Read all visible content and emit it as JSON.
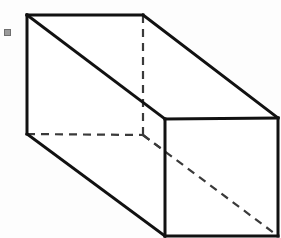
{
  "figure": {
    "caption": "Rectangular prism with dashed hidden edges",
    "background_color": "#fdfdfd",
    "canvas": {
      "width": 281,
      "height": 238
    }
  },
  "style": {
    "solid_edge_color": "#111111",
    "solid_edge_width": 3,
    "hidden_edge_color": "#3a3a3a",
    "hidden_edge_width": 2.2,
    "hidden_edge_dash": "8 6",
    "face_fill": "#ffffff",
    "marker_color": "#9a9a9a",
    "marker_border_color": "#6f6f6f"
  },
  "vertices": {
    "top_front_left": {
      "x": 27,
      "y": 15,
      "label": "A"
    },
    "top_back_left": {
      "x": 143,
      "y": 15,
      "label": "B"
    },
    "top_back_right": {
      "x": 278,
      "y": 118,
      "label": "C"
    },
    "top_front_right": {
      "x": 165,
      "y": 119,
      "label": "D"
    },
    "bottom_front_left": {
      "x": 27,
      "y": 134,
      "label": "E"
    },
    "bottom_back_left": {
      "x": 143,
      "y": 135,
      "label": "F"
    },
    "bottom_back_right": {
      "x": 278,
      "y": 236,
      "label": "G"
    },
    "bottom_front_right": {
      "x": 165,
      "y": 236,
      "label": "H"
    }
  },
  "faces": {
    "left_face_points": "27,15 165,119 165,236 27,134",
    "top_face_points": "27,15 143,15 278,118 165,119",
    "front_face_points": "165,119 278,118 278,236 165,236"
  },
  "solid_edges": [
    {
      "name": "top-left-horizontal-edge",
      "x1": 27,
      "y1": 15,
      "x2": 143,
      "y2": 15
    },
    {
      "name": "top-back-slanted-edge",
      "x1": 143,
      "y1": 15,
      "x2": 278,
      "y2": 118
    },
    {
      "name": "left-vertical-edge",
      "x1": 27,
      "y1": 15,
      "x2": 27,
      "y2": 134
    },
    {
      "name": "upper-face-diagonal-edge",
      "x1": 27,
      "y1": 15,
      "x2": 165,
      "y2": 119
    },
    {
      "name": "lower-face-diagonal-edge",
      "x1": 27,
      "y1": 134,
      "x2": 165,
      "y2": 236
    },
    {
      "name": "front-top-horizontal-edge",
      "x1": 165,
      "y1": 119,
      "x2": 278,
      "y2": 118
    },
    {
      "name": "front-left-vertical-edge",
      "x1": 165,
      "y1": 119,
      "x2": 165,
      "y2": 236
    },
    {
      "name": "front-right-vertical-edge",
      "x1": 278,
      "y1": 118,
      "x2": 278,
      "y2": 236
    },
    {
      "name": "front-bottom-horizontal-edge",
      "x1": 165,
      "y1": 236,
      "x2": 278,
      "y2": 236
    }
  ],
  "hidden_edges": [
    {
      "name": "hidden-vertical-edge",
      "x1": 143,
      "y1": 15,
      "x2": 143,
      "y2": 135
    },
    {
      "name": "hidden-horizontal-edge",
      "x1": 27,
      "y1": 134,
      "x2": 143,
      "y2": 135
    },
    {
      "name": "hidden-diagonal-edge",
      "x1": 143,
      "y1": 135,
      "x2": 278,
      "y2": 236
    }
  ],
  "marker": {
    "name": "corner-speck-mark",
    "x": 4,
    "y": 29,
    "width": 5,
    "height": 5,
    "visible": true
  }
}
